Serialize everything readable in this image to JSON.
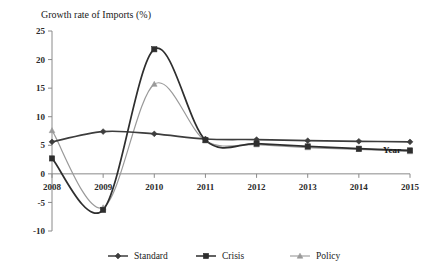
{
  "chart_data": {
    "type": "line",
    "title": "Growth rate of Imports (%)",
    "xlabel": "Year",
    "ylabel": "",
    "categories": [
      "2008",
      "2009",
      "2010",
      "2011",
      "2012",
      "2013",
      "2014",
      "2015"
    ],
    "x": [
      2008,
      2009,
      2010,
      2011,
      2012,
      2013,
      2014,
      2015
    ],
    "xlim": [
      2008,
      2015
    ],
    "ylim": [
      -10,
      25
    ],
    "yticks": [
      "25",
      "20",
      "15",
      "10",
      "5",
      "0",
      "-5",
      "-10"
    ],
    "ytick_values": [
      25,
      20,
      15,
      10,
      5,
      0,
      -5,
      -10
    ],
    "grid": false,
    "smooth": true,
    "legend_position": "bottom",
    "series": [
      {
        "name": "Standard",
        "marker": "diamond",
        "color": "#3d3d3d",
        "values": [
          5.6,
          7.4,
          7.0,
          6.1,
          6.0,
          5.8,
          5.7,
          5.6
        ]
      },
      {
        "name": "Crisis",
        "marker": "square",
        "color": "#2e2e2e",
        "values": [
          2.7,
          -6.3,
          21.8,
          5.9,
          5.3,
          4.8,
          4.4,
          4.1
        ]
      },
      {
        "name": "Policy",
        "marker": "triangle",
        "color": "#9a9a9a",
        "values": [
          7.6,
          -5.9,
          15.7,
          5.8,
          5.1,
          4.6,
          4.3,
          3.9
        ]
      }
    ]
  },
  "legend": {
    "items": [
      {
        "label": "Standard"
      },
      {
        "label": "Crisis"
      },
      {
        "label": "Policy"
      }
    ]
  },
  "colors": {
    "background": "#ffffff",
    "axis": "#8a8a8a",
    "text": "#1a1a1a",
    "standard": "#3d3d3d",
    "crisis": "#2e2e2e",
    "policy": "#9a9a9a"
  }
}
